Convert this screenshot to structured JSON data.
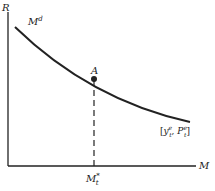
{
  "diagram": {
    "y_axis_label": "R",
    "x_axis_label": "M",
    "curve_label": "M",
    "curve_label_sup": "d",
    "point_label": "A",
    "x_marker_label": "M",
    "x_marker_sup": "*",
    "x_marker_sub": "t",
    "shift_params": {
      "open": "[",
      "y": "y",
      "y_sup": "e",
      "y_sub": "t",
      "sep": ", ",
      "p": "P",
      "p_sup": "e",
      "p_sub": "t",
      "close": "]"
    },
    "line_color": "#222222"
  }
}
